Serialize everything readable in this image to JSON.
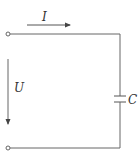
{
  "diagram": {
    "type": "circuit",
    "labels": {
      "current": "I",
      "voltage": "U",
      "capacitor": "C"
    },
    "components": [
      {
        "kind": "terminal",
        "position": "top-left"
      },
      {
        "kind": "terminal",
        "position": "bottom-left"
      },
      {
        "kind": "capacitor",
        "label": "C",
        "position": "right-branch"
      }
    ],
    "colors": {
      "wire": "#555555",
      "text": "#333333"
    }
  }
}
